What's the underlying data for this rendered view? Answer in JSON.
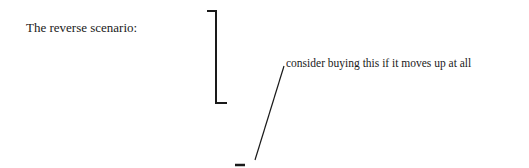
{
  "heading": "The reverse scenario:",
  "annotation": "consider buying this if it moves up at all",
  "colors": {
    "ink": "#1a1a1a",
    "background": "#ffffff"
  }
}
